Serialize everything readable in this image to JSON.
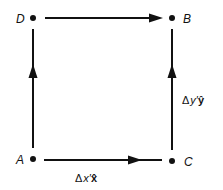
{
  "diagram": {
    "points": [
      {
        "id": "D",
        "label": "D"
      },
      {
        "id": "B",
        "label": "B"
      },
      {
        "id": "A",
        "label": "A"
      },
      {
        "id": "C",
        "label": "C"
      }
    ],
    "edges": [
      {
        "from": "D",
        "to": "B"
      },
      {
        "from": "A",
        "to": "D"
      },
      {
        "from": "C",
        "to": "B",
        "label": {
          "delta": "Δ",
          "var": "y′",
          "unit": "ŷ"
        }
      },
      {
        "from": "A",
        "to": "C",
        "label": {
          "delta": "Δ",
          "var": "x′",
          "unit": "x̂"
        }
      }
    ],
    "colors": {
      "stroke": "#111111",
      "background": "#ffffff"
    }
  }
}
